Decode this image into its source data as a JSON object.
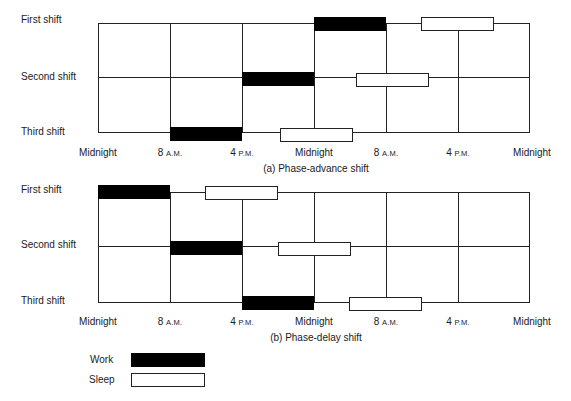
{
  "colors": {
    "work": "#000000",
    "sleep": "#ffffff",
    "line": "#222222"
  },
  "chart_a": {
    "caption": "(a) Phase-advance shift",
    "rows": [
      {
        "label": "First shift"
      },
      {
        "label": "Second shift"
      },
      {
        "label": "Third shift"
      }
    ],
    "axis": [
      {
        "num": "Midnight",
        "suffix": ""
      },
      {
        "num": "8 ",
        "suffix": "A.M."
      },
      {
        "num": "4 ",
        "suffix": "P.M."
      },
      {
        "num": "Midnight",
        "suffix": ""
      },
      {
        "num": "8 ",
        "suffix": "A.M."
      },
      {
        "num": "4 ",
        "suffix": "P.M."
      },
      {
        "num": "Midnight",
        "suffix": ""
      }
    ]
  },
  "chart_b": {
    "caption": "(b) Phase-delay shift",
    "rows": [
      {
        "label": "First shift"
      },
      {
        "label": "Second shift"
      },
      {
        "label": "Third shift"
      }
    ],
    "axis": [
      {
        "num": "Midnight",
        "suffix": ""
      },
      {
        "num": "8 ",
        "suffix": "A.M."
      },
      {
        "num": "4 ",
        "suffix": "P.M."
      },
      {
        "num": "Midnight",
        "suffix": ""
      },
      {
        "num": "8 ",
        "suffix": "A.M."
      },
      {
        "num": "4 ",
        "suffix": "P.M."
      },
      {
        "num": "Midnight",
        "suffix": ""
      }
    ]
  },
  "legend": {
    "work_label": "Work",
    "sleep_label": "Sleep"
  },
  "schedule": {
    "time_axis_hours": [
      0,
      8,
      16,
      24,
      32,
      40,
      48
    ],
    "phase_advance": [
      {
        "shift": "First shift",
        "work": [
          24,
          32
        ],
        "sleep": [
          38,
          46
        ]
      },
      {
        "shift": "Second shift",
        "work": [
          16,
          24
        ],
        "sleep": [
          28,
          36
        ]
      },
      {
        "shift": "Third shift",
        "work": [
          8,
          16
        ],
        "sleep": [
          20,
          28
        ]
      }
    ],
    "phase_delay": [
      {
        "shift": "First shift",
        "work": [
          0,
          8
        ],
        "sleep": [
          12,
          20
        ]
      },
      {
        "shift": "Second shift",
        "work": [
          8,
          16
        ],
        "sleep": [
          20,
          28
        ]
      },
      {
        "shift": "Third shift",
        "work": [
          16,
          24
        ],
        "sleep": [
          28,
          36
        ]
      }
    ]
  }
}
